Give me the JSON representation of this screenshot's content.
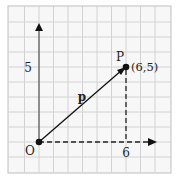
{
  "diagram": {
    "type": "position-vector-grid",
    "grid": {
      "columns": 11,
      "rows": 11,
      "line_color": "#cfcfcf",
      "border_color": "#bdbdbd",
      "background": "#f7f7f7"
    },
    "axes": {
      "x_tick_label": "6",
      "y_tick_label": "5",
      "color": "#555555"
    },
    "origin": {
      "label": "O",
      "coords": [
        0,
        0
      ]
    },
    "point": {
      "label": "P",
      "coords_label": "(6,5)",
      "coords": [
        6,
        5
      ]
    },
    "vector": {
      "label": "p",
      "from": "O",
      "to": "P",
      "color": "#111111"
    },
    "projections": {
      "style": "dashed",
      "color": "#222222"
    }
  }
}
